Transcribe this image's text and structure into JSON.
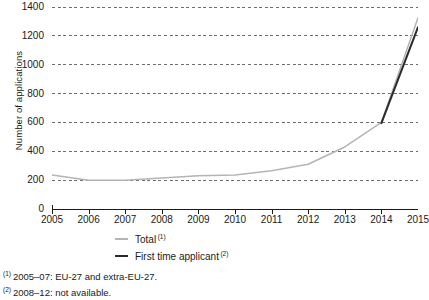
{
  "chart_data": {
    "type": "line",
    "title": "",
    "xlabel": "",
    "ylabel": "Number of applications",
    "x": [
      2005,
      2006,
      2007,
      2008,
      2009,
      2010,
      2011,
      2012,
      2013,
      2014,
      2015
    ],
    "categories": [
      "2005",
      "2006",
      "2007",
      "2008",
      "2009",
      "2010",
      "2011",
      "2012",
      "2013",
      "2014",
      "2015"
    ],
    "xlim": [
      2005,
      2015
    ],
    "ylim": [
      0,
      1400
    ],
    "y_ticks": [
      0,
      200,
      400,
      600,
      800,
      1000,
      1200,
      1400
    ],
    "y_tick_labels": [
      "0",
      "200",
      "400",
      "600",
      "800",
      "1000",
      "1200",
      "1400"
    ],
    "grid": "horizontal-dashed",
    "legend_position": "bottom-center",
    "series": [
      {
        "name": "Total",
        "footnote_mark": "(1)",
        "color": "#b4b4b4",
        "x": [
          2005,
          2006,
          2007,
          2008,
          2009,
          2010,
          2011,
          2012,
          2013,
          2014,
          2015
        ],
        "values": [
          235,
          200,
          200,
          215,
          230,
          235,
          265,
          310,
          430,
          600,
          1325
        ]
      },
      {
        "name": "First time applicant",
        "footnote_mark": "(2)",
        "color": "#2b2b2b",
        "x": [
          2014,
          2015
        ],
        "values": [
          595,
          1260
        ]
      }
    ]
  },
  "axes": {
    "y_title": "Number of applications"
  },
  "legend": {
    "items": [
      {
        "label": "Total",
        "mark": "(1)",
        "color": "#b4b4b4"
      },
      {
        "label": "First time applicant",
        "mark": "(2)",
        "color": "#2b2b2b"
      }
    ]
  },
  "footnotes": [
    {
      "mark": "(1)",
      "text": "2005–07: EU-27 and extra-EU-27."
    },
    {
      "mark": "(2)",
      "text": "2008–12: not available."
    }
  ]
}
